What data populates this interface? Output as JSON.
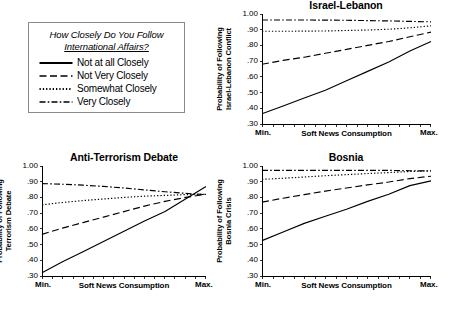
{
  "legend": {
    "title_line1": "How Closely Do You Follow",
    "title_line2": "International Affairs?",
    "items": [
      {
        "label": "Not at all Closely",
        "style": "solid"
      },
      {
        "label": "Not Very Closely",
        "style": "dashed"
      },
      {
        "label": "Somewhat Closely",
        "style": "dotted"
      },
      {
        "label": "Very Closely",
        "style": "dashdot"
      }
    ]
  },
  "axis": {
    "yticks": [
      "1.00",
      ".90",
      ".80",
      ".70",
      ".60",
      ".50",
      ".40",
      ".30"
    ],
    "ytick_values": [
      1.0,
      0.9,
      0.8,
      0.7,
      0.6,
      0.5,
      0.4,
      0.3
    ],
    "xlabel": "Soft News Consumption",
    "xmin_label": "Min.",
    "xmax_label": "Max.",
    "ylim": [
      0.3,
      1.0
    ]
  },
  "chart_data": [
    {
      "id": "israel-lebanon",
      "type": "line",
      "title": "Israel-Lebanon",
      "ylabel_line1": "Probability of Following",
      "ylabel_line2": "Israel-Lebanon Conflict",
      "xlabel": "Soft News Consumption",
      "xlim": [
        0,
        1
      ],
      "ylim": [
        0.3,
        1.0
      ],
      "grid": false,
      "legend_position": "external",
      "x": [
        0,
        0.125,
        0.25,
        0.375,
        0.5,
        0.625,
        0.75,
        0.875,
        1.0
      ],
      "series": [
        {
          "name": "Not at all Closely",
          "style": "solid",
          "values": [
            0.365,
            0.415,
            0.465,
            0.515,
            0.575,
            0.635,
            0.695,
            0.765,
            0.825
          ]
        },
        {
          "name": "Not Very Closely",
          "style": "dashed",
          "values": [
            0.68,
            0.705,
            0.725,
            0.75,
            0.775,
            0.8,
            0.825,
            0.855,
            0.885
          ]
        },
        {
          "name": "Somewhat Closely",
          "style": "dotted",
          "values": [
            0.89,
            0.89,
            0.891,
            0.892,
            0.895,
            0.898,
            0.903,
            0.912,
            0.925
          ]
        },
        {
          "name": "Very Closely",
          "style": "dashdot",
          "values": [
            0.962,
            0.962,
            0.962,
            0.961,
            0.96,
            0.958,
            0.956,
            0.953,
            0.95
          ]
        }
      ]
    },
    {
      "id": "anti-terrorism-debate",
      "type": "line",
      "title": "Anti-Terrorism Debate",
      "ylabel_line1": "Probability of Following",
      "ylabel_line2": "Terrorism Debate",
      "xlabel": "Soft News Consumption",
      "xlim": [
        0,
        1
      ],
      "ylim": [
        0.3,
        1.0
      ],
      "grid": false,
      "legend_position": "external",
      "x": [
        0,
        0.125,
        0.25,
        0.375,
        0.5,
        0.625,
        0.75,
        0.875,
        1.0
      ],
      "series": [
        {
          "name": "Not at all Closely",
          "style": "solid",
          "values": [
            0.32,
            0.39,
            0.455,
            0.52,
            0.585,
            0.65,
            0.71,
            0.79,
            0.87
          ]
        },
        {
          "name": "Not Very Closely",
          "style": "dashed",
          "values": [
            0.565,
            0.605,
            0.64,
            0.675,
            0.71,
            0.745,
            0.775,
            0.8,
            0.82
          ]
        },
        {
          "name": "Somewhat Closely",
          "style": "dotted",
          "values": [
            0.753,
            0.768,
            0.78,
            0.79,
            0.8,
            0.808,
            0.813,
            0.818,
            0.82
          ]
        },
        {
          "name": "Very Closely",
          "style": "dashdot",
          "values": [
            0.888,
            0.884,
            0.878,
            0.87,
            0.86,
            0.848,
            0.836,
            0.826,
            0.818
          ]
        }
      ]
    },
    {
      "id": "bosnia",
      "type": "line",
      "title": "Bosnia",
      "ylabel_line1": "Probability of Following",
      "ylabel_line2": "Bosnia Crisis",
      "xlabel": "Soft News Consumption",
      "xlim": [
        0,
        1
      ],
      "ylim": [
        0.3,
        1.0
      ],
      "grid": false,
      "legend_position": "external",
      "x": [
        0,
        0.125,
        0.25,
        0.375,
        0.5,
        0.625,
        0.75,
        0.875,
        1.0
      ],
      "series": [
        {
          "name": "Not at all Closely",
          "style": "solid",
          "values": [
            0.525,
            0.58,
            0.635,
            0.68,
            0.725,
            0.775,
            0.82,
            0.875,
            0.905
          ]
        },
        {
          "name": "Not Very Closely",
          "style": "dashed",
          "values": [
            0.77,
            0.795,
            0.818,
            0.84,
            0.86,
            0.88,
            0.898,
            0.92,
            0.935
          ]
        },
        {
          "name": "Somewhat Closely",
          "style": "dotted",
          "values": [
            0.915,
            0.922,
            0.93,
            0.938,
            0.945,
            0.952,
            0.958,
            0.965,
            0.97
          ]
        },
        {
          "name": "Very Closely",
          "style": "dashdot",
          "values": [
            0.972,
            0.972,
            0.972,
            0.972,
            0.972,
            0.972,
            0.972,
            0.97,
            0.968
          ]
        }
      ]
    }
  ]
}
